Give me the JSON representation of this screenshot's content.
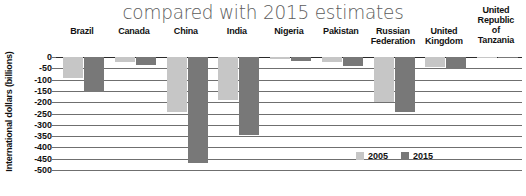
{
  "chart_data": {
    "type": "bar",
    "title": "compared with 2015 estimates",
    "xlabel": "",
    "ylabel": "International dollars (billions)",
    "ylim": [
      -500,
      0
    ],
    "grid": true,
    "legend_position": "bottom-right",
    "categories": [
      "Brazil",
      "Canada",
      "China",
      "India",
      "Nigeria",
      "Pakistan",
      "Russian Federation",
      "United Kingdom",
      "United Republic of Tanzania"
    ],
    "tick_labels": [
      "0",
      "-50",
      "-100",
      "-150",
      "-200",
      "-250",
      "-300",
      "-350",
      "-400",
      "-450",
      "-500"
    ],
    "tick_values": [
      0,
      -50,
      -100,
      -150,
      -200,
      -250,
      -300,
      -350,
      -400,
      -450,
      -500
    ],
    "series": [
      {
        "name": "2005",
        "color": "#c6c6c6",
        "values": [
          -95,
          -20,
          -245,
          -190,
          -8,
          -20,
          -200,
          -45,
          -3
        ]
      },
      {
        "name": "2015",
        "color": "#787878",
        "values": [
          -155,
          -35,
          -470,
          -345,
          -18,
          -40,
          -245,
          -55,
          -5
        ]
      }
    ]
  },
  "legend": {
    "items": [
      {
        "label": "2005",
        "color": "#c6c6c6"
      },
      {
        "label": "2015",
        "color": "#787878"
      }
    ]
  }
}
